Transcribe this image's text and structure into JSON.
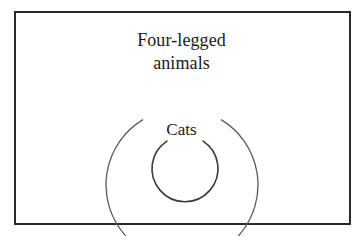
{
  "diagram": {
    "type": "euler-venn-nested",
    "title": "",
    "background_color": "#ffffff",
    "frame": {
      "border_color": "#2a2a2a",
      "border_width_px": 2,
      "x": 14,
      "y": 11,
      "width": 337,
      "height": 214
    },
    "sets": [
      {
        "id": "outer",
        "label_lines": [
          "Four-legged",
          "animals"
        ],
        "label_text": "Four-legged animals",
        "shape": "circle",
        "stroke_color": "#5a5a5a",
        "stroke_width_px": 1.3,
        "center_x": 182,
        "center_y": 137,
        "radius": 76,
        "gap_top_degrees": 62
      },
      {
        "id": "inner",
        "label_lines": [
          "Cats"
        ],
        "label_text": "Cats",
        "shape": "circle",
        "stroke_color": "#3a3a3a",
        "stroke_width_px": 1.6,
        "center_x": 185,
        "center_y": 168,
        "radius": 33,
        "gap_top_degrees": 66
      }
    ],
    "relation": "Cats is a proper subset of Four-legged animals"
  },
  "labels": {
    "outer_line1": "Four-legged",
    "outer_line2": "animals",
    "inner": "Cats"
  }
}
